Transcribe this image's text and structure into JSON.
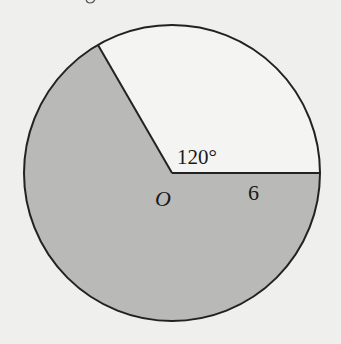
{
  "diagram": {
    "type": "circle-sector",
    "center_label": "O",
    "angle_label": "120°",
    "radius_label": "6",
    "angle_degrees": 120,
    "radius_value": 6,
    "shaded_region": "major sector (240°)",
    "unshaded_region": "minor sector (120°)",
    "colors": {
      "shaded": "#b9b9b7",
      "unshaded": "#f4f4f2",
      "stroke": "#222222",
      "background": "#efefed"
    }
  }
}
